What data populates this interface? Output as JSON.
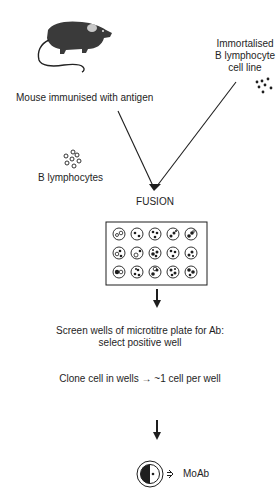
{
  "diagram": {
    "nodes": {
      "mouse": {
        "label": "Mouse immunised with antigen",
        "icon": "mouse-icon"
      },
      "cell_line": {
        "label_lines": [
          "Immortalised",
          "B lymphocyte",
          "cell line"
        ],
        "icon": "cell-cluster-icon"
      },
      "b_lymphocytes": {
        "label": "B lymphocytes",
        "icon": "lymphocyte-cluster-icon"
      },
      "fusion": {
        "label": "FUSION"
      },
      "plate": {
        "icon": "microtitre-plate-icon",
        "rows": 3,
        "cols": 5
      },
      "screen": {
        "label_lines": [
          "Screen wells of microtitre plate for Ab:",
          "select positive well"
        ]
      },
      "clone": {
        "label": "Clone cell in wells → ~1 cell per well"
      },
      "product": {
        "label": "MoAb",
        "icon": "hybridoma-cell-icon",
        "arrow_icon": "secretion-arrow-icon"
      }
    },
    "colors": {
      "ink": "#1e1e1e",
      "mouse_body": "#3a3a3a",
      "mouse_ear": "#c8c8c8",
      "background": "#ffffff"
    }
  }
}
